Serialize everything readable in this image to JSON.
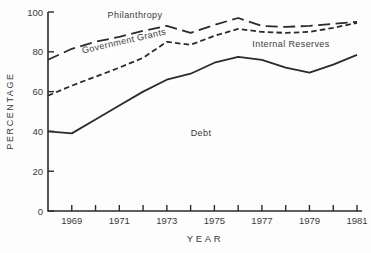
{
  "figure": {
    "background": "#fdfdfd",
    "line_color": "#2b2b2b",
    "text_color": "#3a3a3a"
  },
  "chart_data": {
    "type": "line",
    "title": "",
    "xlabel": "YEAR",
    "ylabel": "PERCENTAGE",
    "xlim": [
      1968,
      1981
    ],
    "ylim": [
      0,
      100
    ],
    "grid": false,
    "legend": "none",
    "note": "Three lines are cumulative percentage boundaries; the text labels name the bands between the lines (Debt below solid line, Internal Reserves between solid and short-dash, Government Grants between short-dash and long-dash, Philanthropy above long-dash).",
    "y_ticks": [
      0,
      20,
      40,
      60,
      80,
      100
    ],
    "x_ticks": [
      1969,
      1970,
      1971,
      1972,
      1973,
      1974,
      1975,
      1976,
      1977,
      1978,
      1979,
      1980,
      1981
    ],
    "x_tick_labels": [
      1969,
      1971,
      1973,
      1975,
      1977,
      1979,
      1981
    ],
    "x": [
      1968,
      1969,
      1970,
      1971,
      1972,
      1973,
      1974,
      1975,
      1976,
      1977,
      1978,
      1979,
      1980,
      1981
    ],
    "series": [
      {
        "name": "Debt upper boundary (solid line)",
        "style": "solid",
        "values": [
          40,
          39,
          46,
          53,
          60,
          66,
          69,
          74.5,
          77.5,
          76,
          72,
          69.5,
          73.5,
          78.5
        ]
      },
      {
        "name": "Internal Reserves upper boundary (short-dash line)",
        "style": "short-dash",
        "values": [
          58,
          63,
          67.5,
          72,
          77,
          85,
          83.5,
          88,
          91.5,
          90,
          89.5,
          90,
          92,
          94.5
        ]
      },
      {
        "name": "Government Grants upper boundary (long-dash line)",
        "style": "long-dash",
        "values": [
          76,
          81.5,
          85,
          87.5,
          90.5,
          93,
          89.5,
          93.5,
          97,
          93,
          92.5,
          93,
          94,
          95
        ]
      }
    ],
    "area_labels": [
      {
        "text": "Philanthropy"
      },
      {
        "text": "Government Grants"
      },
      {
        "text": "Internal Reserves"
      },
      {
        "text": "Debt"
      }
    ]
  }
}
